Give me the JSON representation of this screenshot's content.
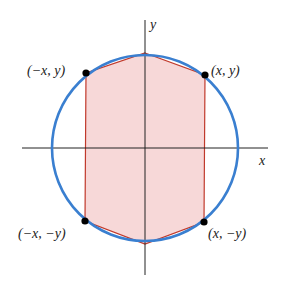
{
  "diagram": {
    "colors": {
      "circle": "#3a7fd0",
      "polygon_stroke": "#c0392b",
      "polygon_fill": "#f7d8d8",
      "axes": "#222222",
      "points": "#000000"
    },
    "axes": {
      "x_label": "x",
      "y_label": "y"
    },
    "circle": {
      "cx": 145,
      "cy": 148,
      "r": 93
    },
    "polygon_vertices": [
      [
        145,
        53
      ],
      [
        205,
        75
      ],
      [
        204,
        222
      ],
      [
        145,
        244
      ],
      [
        85,
        221
      ],
      [
        86,
        73
      ]
    ],
    "points": [
      {
        "name": "point-neg-x-pos-y",
        "label": "(−x, y)",
        "x": 86,
        "y": 73
      },
      {
        "name": "point-pos-x-pos-y",
        "label": "(x, y)",
        "x": 205,
        "y": 75
      },
      {
        "name": "point-neg-x-neg-y",
        "label": "(−x, −y)",
        "x": 85,
        "y": 221
      },
      {
        "name": "point-pos-x-neg-y",
        "label": "(x, −y)",
        "x": 204,
        "y": 222
      }
    ]
  }
}
